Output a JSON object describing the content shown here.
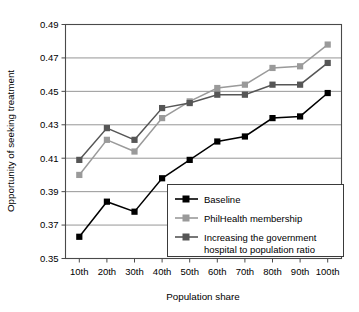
{
  "chart_data": {
    "type": "line",
    "title": "",
    "xlabel": "Population share",
    "ylabel": "Opportunity of seeking treatment",
    "categories": [
      "10th",
      "20th",
      "30th",
      "40th",
      "50th",
      "60th",
      "70th",
      "80th",
      "90th",
      "100th"
    ],
    "ylim": [
      0.35,
      0.49
    ],
    "yticks": [
      "0.35",
      "0.37",
      "0.39",
      "0.41",
      "0.43",
      "0.45",
      "0.47",
      "0.49"
    ],
    "ytick_values": [
      0.35,
      0.37,
      0.39,
      0.41,
      0.43,
      0.45,
      0.47,
      0.49
    ],
    "grid": true,
    "legend_position": "inside-bottom-right",
    "series": [
      {
        "name": "Baseline",
        "color": "#000000",
        "marker": "square",
        "values": [
          0.363,
          0.384,
          0.378,
          0.398,
          0.409,
          0.42,
          0.423,
          0.434,
          0.435,
          0.449
        ]
      },
      {
        "name": "PhilHealth membership",
        "color": "#9a9a9a",
        "marker": "square",
        "values": [
          0.4,
          0.421,
          0.414,
          0.434,
          0.444,
          0.452,
          0.454,
          0.464,
          0.465,
          0.478
        ]
      },
      {
        "name": "Increasing the government hospital to population ratio",
        "color": "#565656",
        "marker": "square",
        "values": [
          0.409,
          0.428,
          0.421,
          0.44,
          0.443,
          0.448,
          0.448,
          0.454,
          0.454,
          0.467
        ]
      }
    ]
  },
  "legend": {
    "items": [
      {
        "label": "Baseline",
        "color": "#000000"
      },
      {
        "label": "PhilHealth membership",
        "color": "#9a9a9a"
      },
      {
        "label": "Increasing the government",
        "label2": "hospital to population ratio",
        "color": "#565656"
      }
    ]
  }
}
